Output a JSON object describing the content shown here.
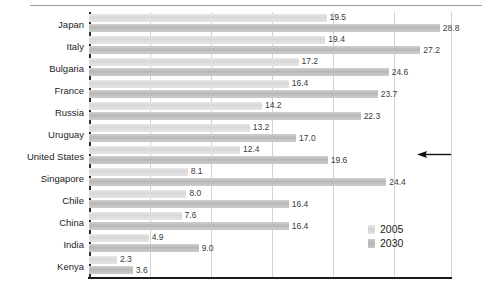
{
  "chart_data": {
    "type": "bar",
    "orientation": "horizontal",
    "title": "",
    "subtitle": "",
    "xlabel": "",
    "ylabel": "",
    "categories": [
      "Japan",
      "Italy",
      "Bulgaria",
      "France",
      "Russia",
      "Uruguay",
      "United States",
      "Singapore",
      "Chile",
      "China",
      "India",
      "Kenya"
    ],
    "series": [
      {
        "name": "2005",
        "values": [
          19.5,
          19.4,
          17.2,
          16.4,
          14.2,
          13.2,
          12.4,
          8.1,
          8.0,
          7.6,
          4.9,
          2.3
        ]
      },
      {
        "name": "2030",
        "values": [
          28.8,
          27.2,
          24.6,
          23.7,
          22.3,
          17.0,
          19.6,
          24.4,
          16.4,
          16.4,
          9.0,
          3.6
        ]
      }
    ],
    "value_labels": {
      "2005": [
        "19.5",
        "19.4",
        "17.2",
        "16.4",
        "14.2",
        "13.2",
        "12.4",
        "8.1",
        "8.0",
        "7.6",
        "4.9",
        "2.3"
      ],
      "2030": [
        "28.8",
        "27.2",
        "24.6",
        "23.7",
        "22.3",
        "17.0",
        "19.6",
        "24.4",
        "16.4",
        "16.4",
        "9.0",
        "3.6"
      ]
    },
    "xlim": [
      0,
      29.8
    ],
    "xticks": [
      5,
      10,
      15,
      20,
      25
    ],
    "xtick_labels": [
      "",
      "",
      "",
      "",
      ""
    ],
    "grid": "vertical",
    "legend": {
      "position": "inside-bottom-right",
      "entries": [
        {
          "label": "2005",
          "color": "#dcdcdc"
        },
        {
          "label": "2030",
          "color": "#bebebe"
        }
      ]
    },
    "annotations": [
      {
        "kind": "arrow",
        "direction": "left",
        "target_category": "United States"
      }
    ],
    "colors": {
      "series_2005": "#dcdcdc",
      "series_2030": "#bebebe",
      "axis": "#1c1c1c",
      "gridline": "#d2d2d2",
      "text": "#1d1d1d",
      "value_text": "#3a3a3a"
    }
  }
}
